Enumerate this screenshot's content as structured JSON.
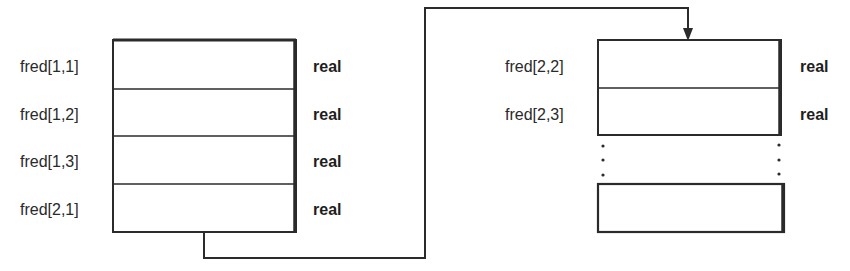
{
  "diagram": {
    "left_block": {
      "cells": [
        {
          "label": "fred[1,1]",
          "type": "real"
        },
        {
          "label": "fred[1,2]",
          "type": "real"
        },
        {
          "label": "fred[1,3]",
          "type": "real"
        },
        {
          "label": "fred[2,1]",
          "type": "real"
        }
      ]
    },
    "right_block": {
      "cells": [
        {
          "label": "fred[2,2]",
          "type": "real"
        },
        {
          "label": "fred[2,3]",
          "type": "real"
        }
      ],
      "ellipsis": "⋮",
      "trailing_cell": {
        "label": "",
        "type": ""
      }
    },
    "connector": {
      "from": "left_block",
      "to": "right_block",
      "arrow": "down-arrow"
    },
    "colors": {
      "stroke": "#2b2b2b",
      "background": "#ffffff"
    }
  }
}
